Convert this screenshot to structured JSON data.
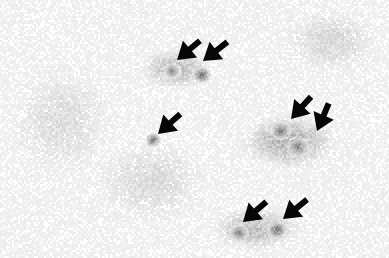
{
  "figure": {
    "kind": "micrograph",
    "modality": "brightfield-histology-immunohistochemistry",
    "title": "",
    "caption": "",
    "scale_bar_label": "",
    "magnification_label": "",
    "width_px": 389,
    "height_px": 258
  },
  "colors": {
    "background": "#ffffff",
    "tissue_light": "#e6e6e6",
    "tissue_mid": "#c9c9c9",
    "tissue_dark": "#9a9a9a",
    "stained_cell": "#8d8d8d",
    "stained_cell_dark": "#6f6f6f",
    "arrow": "#070707"
  },
  "annotations": {
    "arrow_count": 7,
    "arrow_label": "arrow-marker",
    "arrows": [
      {
        "id": "arrow-1",
        "tip_x": 177,
        "tip_y": 60,
        "angle_deg": 220,
        "length": 30,
        "head_len": 17,
        "head_half_width": 11,
        "shaft_width": 6
      },
      {
        "id": "arrow-2",
        "tip_x": 203,
        "tip_y": 61,
        "angle_deg": 218,
        "length": 31,
        "head_len": 17,
        "head_half_width": 11,
        "shaft_width": 6
      },
      {
        "id": "arrow-3",
        "tip_x": 158,
        "tip_y": 134,
        "angle_deg": 222,
        "length": 30,
        "head_len": 17,
        "head_half_width": 11,
        "shaft_width": 6
      },
      {
        "id": "arrow-4",
        "tip_x": 291,
        "tip_y": 119,
        "angle_deg": 228,
        "length": 30,
        "head_len": 17,
        "head_half_width": 11,
        "shaft_width": 6
      },
      {
        "id": "arrow-5",
        "tip_x": 317,
        "tip_y": 131,
        "angle_deg": 247,
        "length": 30,
        "head_len": 17,
        "head_half_width": 11,
        "shaft_width": 6
      },
      {
        "id": "arrow-6",
        "tip_x": 243,
        "tip_y": 222,
        "angle_deg": 221,
        "length": 31,
        "head_len": 17,
        "head_half_width": 11,
        "shaft_width": 6
      },
      {
        "id": "arrow-7",
        "tip_x": 283,
        "tip_y": 219,
        "angle_deg": 219,
        "length": 31,
        "head_len": 17,
        "head_half_width": 11,
        "shaft_width": 6
      }
    ]
  },
  "stained_cells": [
    {
      "id": "cell-1",
      "cx": 201,
      "cy": 74,
      "r": 9.0,
      "darkness": 0.46
    },
    {
      "id": "cell-2",
      "cx": 171,
      "cy": 70,
      "r": 8.5,
      "darkness": 0.34
    },
    {
      "id": "cell-3",
      "cx": 152,
      "cy": 139,
      "r": 7.5,
      "darkness": 0.42
    },
    {
      "id": "cell-4",
      "cx": 280,
      "cy": 130,
      "r": 10.0,
      "darkness": 0.4
    },
    {
      "id": "cell-5",
      "cx": 297,
      "cy": 146,
      "r": 11.0,
      "darkness": 0.38
    },
    {
      "id": "cell-6",
      "cx": 238,
      "cy": 232,
      "r": 9.5,
      "darkness": 0.38
    },
    {
      "id": "cell-7",
      "cx": 276,
      "cy": 229,
      "r": 9.5,
      "darkness": 0.46
    }
  ],
  "tissue_regions": [
    {
      "id": "region-upper-mid-dense",
      "cx": 175,
      "cy": 68,
      "rx": 40,
      "ry": 22,
      "darkness": 0.2
    },
    {
      "id": "region-right-dense",
      "cx": 288,
      "cy": 140,
      "rx": 52,
      "ry": 30,
      "darkness": 0.24
    },
    {
      "id": "region-bottom-mid-dense",
      "cx": 255,
      "cy": 228,
      "rx": 48,
      "ry": 24,
      "darkness": 0.2
    },
    {
      "id": "region-left-sparse",
      "cx": 60,
      "cy": 120,
      "rx": 55,
      "ry": 60,
      "darkness": 0.08
    },
    {
      "id": "region-top-right-sparse",
      "cx": 330,
      "cy": 40,
      "rx": 50,
      "ry": 35,
      "darkness": 0.1
    },
    {
      "id": "region-center-sparse",
      "cx": 150,
      "cy": 180,
      "rx": 60,
      "ry": 45,
      "darkness": 0.09
    }
  ],
  "texture": {
    "halftone_cell_px": 2,
    "speckle_density": 0.3,
    "base_gray": 252,
    "noise_seed": 20947
  }
}
